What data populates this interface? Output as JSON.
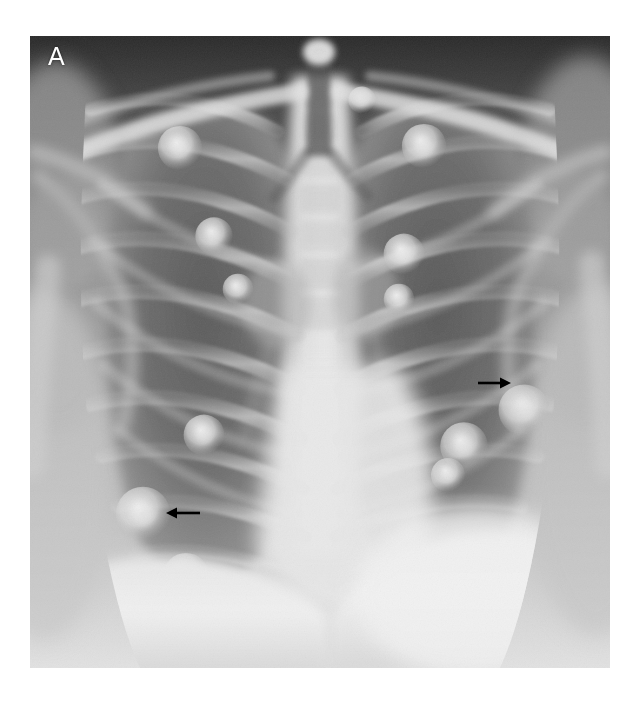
{
  "figure": {
    "panel_label": "A",
    "modality": "chest-radiograph",
    "view": "frontal-posteroanterior",
    "background_color": "#ffffff",
    "frame": {
      "x": 30,
      "y": 36,
      "width": 580,
      "height": 632
    },
    "tone": {
      "darkest": "#272727",
      "lung_mid": "#7f7f7f",
      "soft_tissue": "#b4b4b4",
      "bone": "#d8d8d8",
      "brightest": "#f2f2f2",
      "annotation": "#000000",
      "label": "#ffffff"
    }
  },
  "annotations": {
    "arrows": [
      {
        "id": "arrow-right-lung-nodule",
        "direction": "left",
        "tail_x": 200,
        "head_x": 166,
        "y": 513,
        "target": "nodular-opacity-right-lower-zone"
      },
      {
        "id": "arrow-left-lung-nodule",
        "direction": "right",
        "tail_x": 478,
        "head_x": 511,
        "y": 383,
        "target": "nodular-opacity-left-mid-zone"
      }
    ]
  },
  "anatomy": {
    "structures": [
      "trachea",
      "clavicles",
      "scapulae",
      "ribs",
      "thoracic-spine",
      "mediastinum",
      "cardiac-silhouette",
      "hemidiaphragms",
      "costophrenic-angles",
      "lung-fields"
    ],
    "nodules": [
      {
        "cx": 180,
        "cy": 148,
        "r": 13
      },
      {
        "cx": 214,
        "cy": 236,
        "r": 11
      },
      {
        "cx": 238,
        "cy": 289,
        "r": 9
      },
      {
        "cx": 204,
        "cy": 435,
        "r": 12
      },
      {
        "cx": 143,
        "cy": 514,
        "r": 16
      },
      {
        "cx": 186,
        "cy": 575,
        "r": 13
      },
      {
        "cx": 96,
        "cy": 620,
        "r": 11
      },
      {
        "cx": 424,
        "cy": 146,
        "r": 13
      },
      {
        "cx": 404,
        "cy": 254,
        "r": 12
      },
      {
        "cx": 399,
        "cy": 299,
        "r": 9
      },
      {
        "cx": 524,
        "cy": 410,
        "r": 15
      },
      {
        "cx": 464,
        "cy": 446,
        "r": 14
      },
      {
        "cx": 448,
        "cy": 475,
        "r": 10
      },
      {
        "cx": 510,
        "cy": 600,
        "r": 15
      },
      {
        "cx": 362,
        "cy": 100,
        "r": 8
      }
    ]
  }
}
